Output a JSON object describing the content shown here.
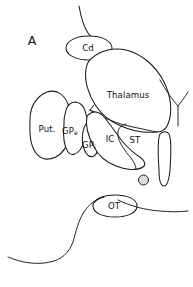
{
  "figure": {
    "panel_label": "A",
    "type": "line-drawing",
    "background_color": "#ffffff",
    "line_color": "#1a1a1a",
    "width": 193,
    "height": 287
  },
  "labels": {
    "caudate": "Cd",
    "thalamus": "Thalamus",
    "putamen": "Put.",
    "globus_pallidus_externa_base": "GP",
    "globus_pallidus_externa_sub": "e",
    "globus_pallidus_interna_base": "GP",
    "globus_pallidus_interna_sub": "i",
    "internal_capsule": "IC",
    "subthalamic": "ST",
    "optic_tract": "OT"
  },
  "structures": [
    {
      "name": "caudate-nucleus",
      "abbr": "Cd"
    },
    {
      "name": "thalamus",
      "abbr": "Thalamus"
    },
    {
      "name": "putamen",
      "abbr": "Put."
    },
    {
      "name": "globus-pallidus-externa",
      "abbr": "GPe"
    },
    {
      "name": "globus-pallidus-interna",
      "abbr": "GPi"
    },
    {
      "name": "internal-capsule",
      "abbr": "IC"
    },
    {
      "name": "subthalamic-nucleus",
      "abbr": "ST"
    },
    {
      "name": "optic-tract",
      "abbr": "OT"
    },
    {
      "name": "hatched-marker",
      "abbr": ""
    },
    {
      "name": "vertical-tract",
      "abbr": ""
    }
  ]
}
